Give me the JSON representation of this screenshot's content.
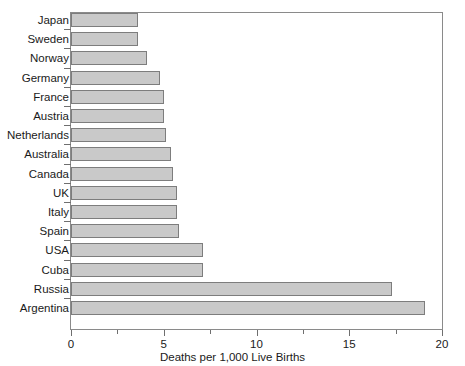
{
  "chart_data": {
    "type": "bar",
    "orientation": "horizontal",
    "title": "",
    "xlabel": "Deaths per 1,000 Live Births",
    "ylabel": "",
    "xlim": [
      0,
      20
    ],
    "xticks": [
      0,
      5,
      10,
      15,
      20
    ],
    "xtick_labels": [
      "0",
      "5",
      "10",
      "15",
      "20"
    ],
    "xticks_minor": [
      2.5,
      7.5,
      12.5,
      17.5
    ],
    "grid": false,
    "legend": null,
    "bar_color": "#c9c9c9",
    "bar_edge_color": "#7d7d7d",
    "categories": [
      "Japan",
      "Sweden",
      "Norway",
      "Germany",
      "France",
      "Austria",
      "Netherlands",
      "Australia",
      "Canada",
      "UK",
      "Italy",
      "Spain",
      "USA",
      "Cuba",
      "Russia",
      "Argentina"
    ],
    "values": [
      3.6,
      3.6,
      4.1,
      4.8,
      5.0,
      5.0,
      5.1,
      5.4,
      5.5,
      5.7,
      5.7,
      5.8,
      7.1,
      7.1,
      17.3,
      19.1
    ]
  }
}
